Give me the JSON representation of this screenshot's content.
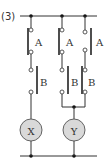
{
  "problem_number": "(3)",
  "columns": [
    {
      "id": "col1",
      "switches": [
        {
          "label": "A",
          "type": "normally-closed"
        },
        {
          "label": "B",
          "type": "normally-open"
        }
      ],
      "output": "X"
    },
    {
      "id": "col2",
      "switches": [
        {
          "label": "A",
          "type": "normally-closed"
        },
        {
          "label": "B",
          "type": "normally-open"
        }
      ],
      "output": "Y"
    },
    {
      "id": "col3",
      "switches": [
        {
          "label": "A",
          "type": "normally-open"
        },
        {
          "label": "B",
          "type": "normally-closed"
        }
      ],
      "output": "Y"
    }
  ],
  "lamps": [
    {
      "label": "X",
      "fill": "#d9d9d9"
    },
    {
      "label": "Y",
      "fill": "#d9d9d9"
    }
  ]
}
